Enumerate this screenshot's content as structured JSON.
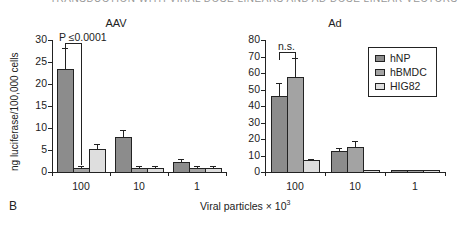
{
  "header_fragment": "TRANSDUCTION WITH VIRAL DOSE LINEARS AND AD DOSE LINEAR VECTORS",
  "panel_label": "B",
  "x_axis_title": "Viral particles × 10",
  "x_axis_title_exp": "3",
  "colors": {
    "hNP": "#8c8c8c",
    "hBMDC": "#a3a3a3",
    "HIG82": "#dedede"
  },
  "chart_data": [
    {
      "type": "bar",
      "title": "AAV",
      "xlabel": "Viral particles × 10^3",
      "ylabel": "ng luciferase/100,000 cells",
      "ylim": [
        0,
        30
      ],
      "yticks": [
        0,
        5,
        10,
        15,
        20,
        25,
        30
      ],
      "categories": [
        "100",
        "10",
        "1"
      ],
      "grid": false,
      "series": [
        {
          "name": "hNP",
          "values": [
            23.5,
            8.0,
            2.2
          ],
          "errors": [
            4.7,
            1.5,
            0.7
          ]
        },
        {
          "name": "hBMDC",
          "values": [
            1.0,
            1.0,
            0.9
          ],
          "errors": [
            0.3,
            0.3,
            0.4
          ]
        },
        {
          "name": "HIG82",
          "values": [
            5.3,
            1.0,
            1.0
          ],
          "errors": [
            1.0,
            0.3,
            0.3
          ]
        }
      ],
      "annotations": [
        {
          "text": "P ≤0.0001",
          "between": [
            "hNP@100",
            "hBMDC@100"
          ]
        }
      ]
    },
    {
      "type": "bar",
      "title": "Ad",
      "xlabel": "Viral particles × 10^3",
      "ylabel": "",
      "ylim": [
        0,
        80
      ],
      "yticks": [
        0,
        10,
        20,
        30,
        40,
        50,
        60,
        70,
        80
      ],
      "categories": [
        "100",
        "10",
        "1"
      ],
      "grid": false,
      "legend_position": "upper right",
      "series": [
        {
          "name": "hNP",
          "values": [
            46,
            12.5,
            1
          ],
          "errors": [
            8,
            2,
            0
          ]
        },
        {
          "name": "hBMDC",
          "values": [
            57.5,
            15,
            1
          ],
          "errors": [
            11.5,
            3.5,
            0
          ]
        },
        {
          "name": "HIG82",
          "values": [
            7,
            1,
            1
          ],
          "errors": [
            1,
            0,
            0
          ]
        }
      ],
      "annotations": [
        {
          "text": "n.s.",
          "between": [
            "hNP@100",
            "hBMDC@100"
          ]
        }
      ]
    }
  ],
  "legend": [
    {
      "label": "hNP"
    },
    {
      "label": "hBMDC"
    },
    {
      "label": "HIG82"
    }
  ]
}
